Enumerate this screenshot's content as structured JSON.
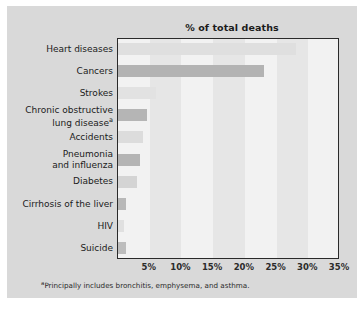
{
  "chart_data": {
    "type": "bar",
    "orientation": "horizontal",
    "title": "% of total deaths",
    "xlabel": "",
    "ylabel": "",
    "xlim": [
      0,
      35
    ],
    "xticks": [
      "5%",
      "10%",
      "15%",
      "20%",
      "25%",
      "30%",
      "35%"
    ],
    "xtick_values": [
      5,
      10,
      15,
      20,
      25,
      30,
      35
    ],
    "grid": "alternating vertical bands every 5%",
    "legend": "none",
    "categories": [
      "Heart diseases",
      "Cancers",
      "Strokes",
      "Chronic obstructive\nlung disease",
      "Accidents",
      "Pneumonia\nand influenza",
      "Diabetes",
      "Cirrhosis of the liver",
      "HIV",
      "Suicide"
    ],
    "values": [
      28.0,
      23.0,
      6.0,
      4.5,
      4.0,
      3.5,
      3.0,
      1.3,
      1.0,
      1.3
    ],
    "bar_colors": [
      "#dfdfdf",
      "#b3b3b3",
      "#e2e2e2",
      "#b5b5b5",
      "#dcdcdc",
      "#b4b4b4",
      "#d4d4d4",
      "#b8b8b8",
      "#e0e0e0",
      "#bdbdbd"
    ],
    "annotations": {
      "footnote_marker": "a",
      "footnote_text": "Principally includes bronchitis, emphysema, and asthma.",
      "footnote_attached_to": "Chronic obstructive lung disease"
    },
    "colors": {
      "figure_background": "#d9d9d9",
      "plot_background": "#f2f2f2",
      "band": "#e6e6e6",
      "axis_border": "#2a2a2a",
      "text": "#1b1b1b"
    }
  }
}
